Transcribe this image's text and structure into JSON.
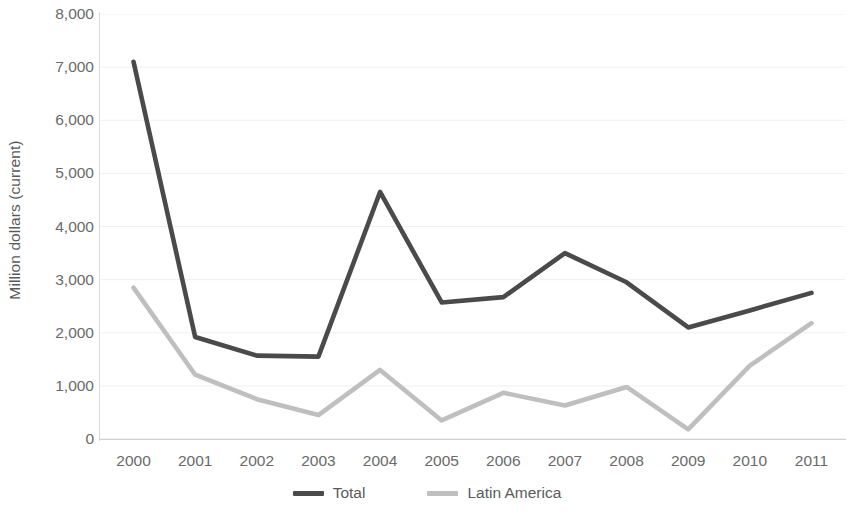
{
  "chart_data": {
    "type": "line",
    "title": "",
    "xlabel": "",
    "ylabel": "Million dollars (current)",
    "categories": [
      "2000",
      "2001",
      "2002",
      "2003",
      "2004",
      "2005",
      "2006",
      "2007",
      "2008",
      "2009",
      "2010",
      "2011"
    ],
    "x": [
      2000,
      2001,
      2002,
      2003,
      2004,
      2005,
      2006,
      2007,
      2008,
      2009,
      2010,
      2011
    ],
    "ylim": [
      0,
      8000
    ],
    "xlim": [
      2000,
      2011
    ],
    "yticks": [
      0,
      1000,
      2000,
      3000,
      4000,
      5000,
      6000,
      7000,
      8000
    ],
    "ytick_labels": [
      "0",
      "1,000",
      "2,000",
      "3,000",
      "4,000",
      "5,000",
      "6,000",
      "7,000",
      "8,000"
    ],
    "grid": true,
    "grid_axis": "y",
    "legend_position": "bottom",
    "series": [
      {
        "name": "Total",
        "color": "#4a4a4a",
        "values": [
          7100,
          1920,
          1570,
          1550,
          4650,
          2570,
          2670,
          3500,
          2950,
          2100,
          2420,
          2750
        ]
      },
      {
        "name": "Latin America",
        "color": "#bfbfbf",
        "values": [
          2850,
          1210,
          750,
          450,
          1300,
          350,
          870,
          630,
          980,
          180,
          1380,
          2180
        ]
      }
    ]
  },
  "legend": {
    "items": [
      {
        "label": "Total",
        "color": "#4a4a4a"
      },
      {
        "label": "Latin America",
        "color": "#bfbfbf"
      }
    ]
  },
  "colors": {
    "total_line": "#4a4a4a",
    "latin_america_line": "#bfbfbf",
    "gridline": "#f0f0f0",
    "axis": "#d9d9d9",
    "tick_text": "#6a6a6a",
    "background": "#ffffff"
  }
}
